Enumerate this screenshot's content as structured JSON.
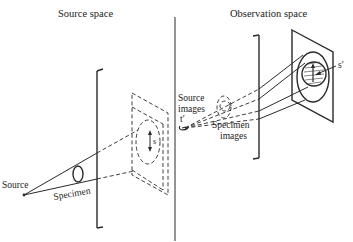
{
  "diagram": {
    "titles": {
      "source_space": "Source space",
      "observation_space": "Observation space"
    },
    "labels": {
      "source": "Source",
      "specimen": "Specimen",
      "s": "s",
      "source_images_line1": "Source",
      "source_images_line2": "images",
      "t_prime": "t′",
      "specimen_images_line1": "Specimen",
      "specimen_images_line2": "images",
      "s_prime": "s′"
    },
    "colors": {
      "ink": "#2a2a2a",
      "background": "#ffffff"
    }
  }
}
